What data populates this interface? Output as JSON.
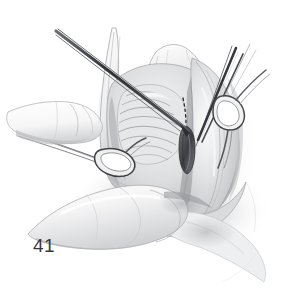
{
  "figure": {
    "number": "41",
    "caption": "",
    "medium": "grayscale pencil-and-wash surgical illustration",
    "background_color": "#ffffff",
    "width": 305,
    "height": 291
  },
  "palette": {
    "background": "#ffffff",
    "line_dark": "#2b2b2b",
    "line_mid": "#6e6e6e",
    "line_light": "#a8a8a8",
    "wash_pale": "#e9e9ea",
    "wash_mid": "#cfd0d2",
    "wash_deep": "#9a9b9e",
    "shadow_deep": "#6a6b6f",
    "instrument_steel": "#3a3c40",
    "label_text": "#3a3a3a",
    "tissue_highlight": "#f6f6f7"
  },
  "elements": {
    "needle_holder": {
      "name": "suture needle and holder entering from upper left",
      "label": "needle-holder-instrument"
    },
    "right_instruments": {
      "name": "pair of dark instrument shafts descending from upper right",
      "label": "forceps-shafts"
    },
    "right_hook_retractor": {
      "name": "ring-handled hook retractor at right of the wound",
      "label": "hook-retractor-right"
    },
    "left_retractor": {
      "name": "ring-handled retractor held in the left hand at the lower left of the wound",
      "label": "retractor-left"
    },
    "upper_finger": {
      "name": "index finger of the left hand approaching from the left",
      "label": "finger-upper-left"
    },
    "lower_finger": {
      "name": "finger pressing the lower tissue margin",
      "label": "finger-lower"
    },
    "tissue_flap_upper": {
      "name": "retracted tissue flap forming the upper margin of the wound",
      "label": "tissue-flap-upper"
    },
    "tissue_mass_right": {
      "name": "bulging tissue mass at the right of the wound",
      "label": "tissue-mass-right"
    },
    "ribbed_structure": {
      "name": "ribbed, striated anatomical structure in the depth of the wound",
      "label": "ribbed-structure"
    },
    "dashed_suture": {
      "name": "dashed line indicating the intended suture path",
      "label": "dashed-suture-line"
    },
    "dark_tissue_fold": {
      "name": "dark elongated tissue fold where the needle is passed",
      "label": "dark-tissue-fold"
    }
  }
}
